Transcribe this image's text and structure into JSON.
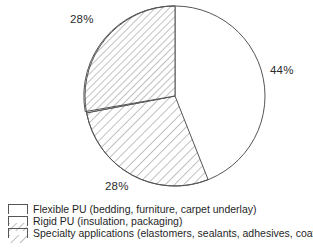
{
  "chart_data": {
    "type": "pie",
    "title": "",
    "categories": [
      "Flexible PU (bedding, furniture, carpet underlay)",
      "Rigid PU (insulation, packaging)",
      "Specialty applications (elastomers, sealants, adhesives, coatings)"
    ],
    "values": [
      44,
      28,
      28
    ],
    "value_labels": [
      "44%",
      "28%",
      "28%"
    ],
    "units": "percent",
    "legend_position": "bottom",
    "grid": false,
    "slice_patterns": [
      "dense-crosshatch-dots",
      "fine-diagonal-hatch",
      "wide-diagonal-hatch"
    ],
    "start_angle_deg": 0,
    "direction": "clockwise",
    "outline_color": "#555555",
    "fill_color": "#ffffff",
    "hatch_color": "#8a8a8a"
  },
  "labels": {
    "top_left": "28%",
    "right": "44%",
    "bottom": "28%"
  },
  "legend": {
    "items": [
      {
        "swatch": "dense-crosshatch-swatch",
        "label": "Flexible PU (bedding, furniture, carpet underlay)"
      },
      {
        "swatch": "fine-diagonal-swatch",
        "label": "Rigid PU (insulation, packaging)"
      },
      {
        "swatch": "wide-diagonal-swatch",
        "label": "Specialty applications (elastomers, sealants, adhesives, coatings)"
      }
    ]
  }
}
